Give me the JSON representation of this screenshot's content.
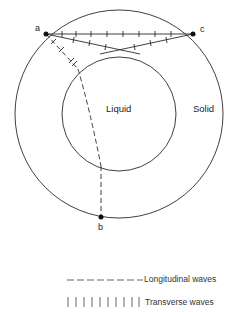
{
  "diagram": {
    "points": {
      "a": "a",
      "b": "b",
      "c": "c"
    },
    "regions": {
      "inner": "Liquid",
      "outer": "Solid"
    },
    "legend": [
      {
        "symbol": "dashed-line",
        "label": "Longitudinal waves"
      },
      {
        "symbol": "tick-line",
        "label": "Transverse waves"
      }
    ],
    "colors": {
      "line": "#2a2a2a",
      "background": "#ffffff"
    }
  }
}
